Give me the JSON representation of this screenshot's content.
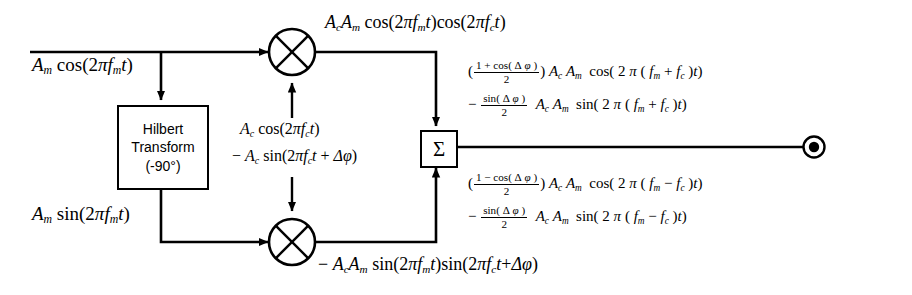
{
  "diagram": {
    "background_color": "#ffffff",
    "line_color": "#000000"
  },
  "inputs": {
    "top_signal": "A_m cos(2πf_m t)",
    "bottom_signal": "A_m sin(2πf_m t)"
  },
  "blocks": {
    "hilbert": {
      "line1": "Hilbert",
      "line2": "Transform",
      "line3": "(-90°)"
    },
    "summer": {
      "symbol": "Σ"
    },
    "mixer_top": {
      "name": "multiplier",
      "symbol": "⊗"
    },
    "mixer_bottom": {
      "name": "multiplier",
      "symbol": "⊗"
    },
    "output_terminal": {
      "name": "output-port"
    }
  },
  "carriers": {
    "top_carrier": "A_c cos(2πf_c t)",
    "bottom_carrier": "− A_c sin(2πf_c t + Δφ)"
  },
  "mixer_outputs": {
    "top": "A_c A_m cos(2πf_m t) cos(2πf_c t)",
    "bottom": "− A_c A_m sin(2πf_m t)sin(2πf_c t + Δφ)"
  },
  "equations": {
    "upper": {
      "line1": "( (1 + cos( Δ φ )) / 2 ) A_c A_m cos( 2 π ( f_m + f_c )t)",
      "line2": "− ( sin( Δ φ ) / 2 ) A_c A_m sin( 2 π ( f_m + f_c )t)"
    },
    "lower": {
      "line1": "( (1 − cos( Δ φ )) / 2 ) A_c A_m cos( 2 π ( f_m − f_c )t)",
      "line2": "− ( sin( Δ φ ) / 2 ) A_c A_m sin( 2 π ( f_m − f_c )t)"
    }
  },
  "symbols": {
    "A": "A",
    "c": "c",
    "m": "m",
    "f": "f",
    "t": "t",
    "pi": "π",
    "two": "2",
    "one": "1",
    "delta": "Δ",
    "phi": "φ",
    "plus": "+",
    "minus": "−",
    "cos": "cos",
    "sin": "sin",
    "lparen": "(",
    "rparen": ")",
    "sigma": "Σ",
    "deg_minus90": "(-90°)"
  }
}
